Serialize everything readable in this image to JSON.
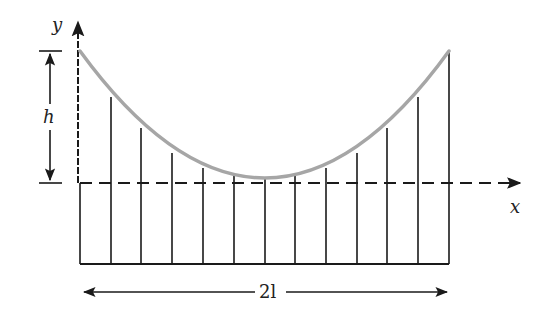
{
  "diagram": {
    "colors": {
      "ink": "#1a1a1a",
      "curve": "#a6a6a6",
      "background": "#ffffff"
    },
    "labels": {
      "y_axis": "y",
      "x_axis": "x",
      "height": "h",
      "span": "2l"
    },
    "axes": {
      "origin_px": [
        80,
        183
      ],
      "y_axis_top_px": 18,
      "x_axis_right_px": 522
    },
    "curve": {
      "type": "parabola",
      "vertex_px": [
        265,
        178
      ],
      "ends_px": [
        [
          80,
          51
        ],
        [
          449,
          51
        ]
      ],
      "color": "#a6a6a6"
    },
    "hangers": {
      "count": 13,
      "x_px": [
        80,
        111,
        141,
        172,
        203,
        234,
        265,
        295,
        326,
        357,
        387,
        418,
        449
      ],
      "top_y_px": [
        51,
        97,
        128,
        153,
        168,
        176,
        178,
        176,
        168,
        153,
        128,
        97,
        51
      ],
      "bottom_y_px": 264
    },
    "dimensions": {
      "height": {
        "label": "h",
        "x_px": 50,
        "from_y": 51,
        "to_y": 183
      },
      "span": {
        "label": "2l",
        "y_px": 292,
        "from_x": 82,
        "to_x": 449
      }
    }
  }
}
